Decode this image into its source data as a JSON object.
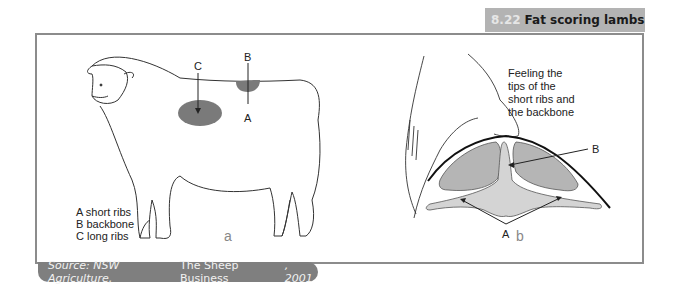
{
  "header": {
    "figure_number": "8.22",
    "title": "Fat scoring lambs"
  },
  "panel_a": {
    "label": "a",
    "markers": {
      "c": "C",
      "b": "B",
      "a": "A"
    },
    "legend": [
      "A short ribs",
      "B backbone",
      "C long ribs"
    ]
  },
  "panel_b": {
    "label": "b",
    "caption_lines": [
      "Feeling the",
      "tips of the",
      "short ribs and",
      "the backbone"
    ],
    "markers": {
      "b": "B",
      "a": "A"
    }
  },
  "source": {
    "prefix": "Source: NSW Agriculture, ",
    "work": "The Sheep Business",
    "suffix": ", 2001"
  },
  "colors": {
    "title_bar": "#b3b3b3",
    "frame_border": "#8c8c8c",
    "source_bg": "#7f7f7f",
    "fat_dark": "#7a7a7a",
    "muscle_fill": "#b5b5b5",
    "bone_fill": "#d4d4d4"
  }
}
